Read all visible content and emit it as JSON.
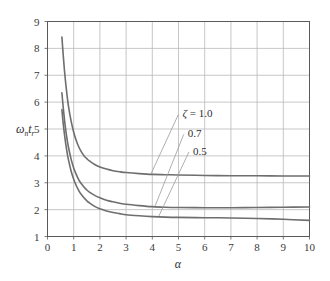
{
  "chart_data": {
    "type": "line",
    "title": "",
    "subtitle": "",
    "xlabel": "α",
    "ylabel": "ωₙtᵣ",
    "ylabel_parts": {
      "main1": "ω",
      "sub1": "n",
      "main2": "t",
      "sub2": "r"
    },
    "xlim": [
      0,
      10
    ],
    "ylim": [
      1,
      9
    ],
    "xticks": [
      "0",
      "1",
      "2",
      "3",
      "4",
      "5",
      "6",
      "7",
      "8",
      "9",
      "10"
    ],
    "yticks": [
      "1",
      "2",
      "3",
      "4",
      "5",
      "6",
      "7",
      "8",
      "9"
    ],
    "grid": true,
    "legend_position": "inside-upper-right",
    "legend_prefix": "ζ =",
    "series": [
      {
        "name": "ζ = 1.0",
        "label": "1.0",
        "color": "#6e6e6e",
        "asymptote": 3.25,
        "x": [
          0.55,
          0.6,
          0.65,
          0.7,
          0.75,
          0.8,
          0.9,
          1.0,
          1.1,
          1.2,
          1.3,
          1.4,
          1.5,
          1.6,
          1.8,
          2.0,
          2.25,
          2.5,
          2.75,
          3.0,
          3.5,
          4.0,
          4.5,
          5.0,
          6.0,
          7.0,
          8.0,
          9.0,
          10.0
        ],
        "y": [
          8.42,
          7.75,
          7.15,
          6.65,
          6.22,
          5.85,
          5.3,
          4.88,
          4.56,
          4.32,
          4.14,
          4.0,
          3.9,
          3.81,
          3.68,
          3.59,
          3.51,
          3.45,
          3.41,
          3.38,
          3.34,
          3.31,
          3.3,
          3.29,
          3.27,
          3.26,
          3.26,
          3.25,
          3.25
        ]
      },
      {
        "name": "ζ = 0.7",
        "label": "0.7",
        "color": "#6e6e6e",
        "asymptote": 2.1,
        "x": [
          0.55,
          0.6,
          0.65,
          0.7,
          0.75,
          0.8,
          0.9,
          1.0,
          1.1,
          1.2,
          1.3,
          1.4,
          1.5,
          1.6,
          1.8,
          2.0,
          2.25,
          2.5,
          2.75,
          3.0,
          3.5,
          4.0,
          4.5,
          5.0,
          6.0,
          7.0,
          8.0,
          9.0,
          10.0
        ],
        "y": [
          6.35,
          5.8,
          5.33,
          4.93,
          4.6,
          4.32,
          3.88,
          3.55,
          3.3,
          3.1,
          2.95,
          2.83,
          2.73,
          2.65,
          2.53,
          2.44,
          2.35,
          2.29,
          2.24,
          2.2,
          2.15,
          2.11,
          2.09,
          2.08,
          2.07,
          2.07,
          2.08,
          2.09,
          2.1
        ]
      },
      {
        "name": "ζ = 0.5",
        "label": "0.5",
        "color": "#6e6e6e",
        "asymptote": 1.6,
        "x": [
          0.55,
          0.6,
          0.65,
          0.7,
          0.75,
          0.8,
          0.9,
          1.0,
          1.1,
          1.2,
          1.3,
          1.4,
          1.5,
          1.6,
          1.8,
          2.0,
          2.25,
          2.5,
          2.75,
          3.0,
          3.5,
          4.0,
          4.5,
          5.0,
          6.0,
          7.0,
          8.0,
          9.0,
          10.0
        ],
        "y": [
          5.72,
          5.2,
          4.78,
          4.42,
          4.11,
          3.85,
          3.44,
          3.13,
          2.89,
          2.7,
          2.55,
          2.43,
          2.33,
          2.25,
          2.12,
          2.03,
          1.95,
          1.89,
          1.85,
          1.81,
          1.77,
          1.74,
          1.72,
          1.71,
          1.7,
          1.69,
          1.67,
          1.64,
          1.6
        ]
      }
    ],
    "annotations": [
      {
        "text": "ζ = 1.0",
        "leader_from": [
          5.0,
          5.55
        ],
        "leader_to": [
          3.95,
          3.33
        ]
      },
      {
        "text": "0.7",
        "leader_from": [
          5.2,
          4.8
        ],
        "leader_to": [
          4.1,
          2.12
        ]
      },
      {
        "text": "0.5",
        "leader_from": [
          5.4,
          4.15
        ],
        "leader_to": [
          4.25,
          1.76
        ]
      }
    ]
  },
  "style": {
    "curve_color": "#6e6e6e",
    "grid_color": "#b9b9b9",
    "frame_color": "#5a5a5a",
    "text_color": "#2e2e2e",
    "background": "#ffffff",
    "leader_color": "#9a9a9a"
  }
}
